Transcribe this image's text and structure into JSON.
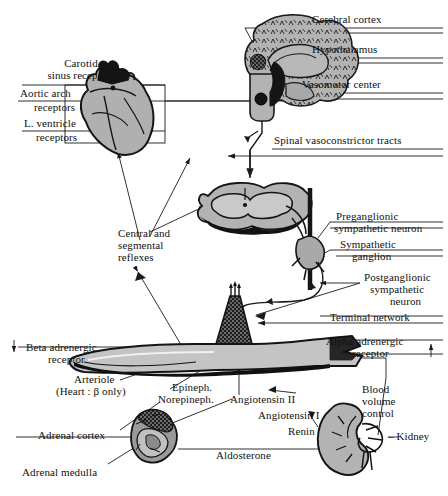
{
  "figure": {
    "type": "anatomical-flow-diagram",
    "background_color": "#ffffff",
    "line_color": "#1a1a1a",
    "organ_fill_color": "#b3b3b3",
    "dark_fill_color": "#141414"
  },
  "labels": {
    "cerebral_cortex": "Cerebral cortex",
    "hypothalamus": "Hypothalamus",
    "vasomotor_center": "Vasomotor center",
    "spinal_vasoconstrictor_tracts": "Spinal vasoconstrictor tracts",
    "carotid_sinus_receptors_l1": "Carotid",
    "carotid_sinus_receptors_l2": "sinus receptors",
    "aortic_arch_receptors_l1": "Aortic arch",
    "aortic_arch_receptors_l2": "receptors",
    "l_ventricle_receptors_l1": "L. ventricle",
    "l_ventricle_receptors_l2": "receptors",
    "central_segmental_reflexes_l1": "Central and",
    "central_segmental_reflexes_l2": "segmental",
    "central_segmental_reflexes_l3": "reflexes",
    "preganglionic_l1": "Preganglionic",
    "preganglionic_l2": "sympathetic neuron",
    "sympathetic_ganglion_l1": "Sympathetic",
    "sympathetic_ganglion_l2": "ganglion",
    "postganglionic_l1": "Postganglionic",
    "postganglionic_l2": "sympathetic",
    "postganglionic_l3": "neuron",
    "terminal_network": "Terminal network",
    "alpha_adrenergic_l1": "Alpha adrenergic",
    "alpha_adrenergic_l2": "receptor",
    "beta_adrenergic_l1": "Beta adrenergic",
    "beta_adrenergic_l2": "receptor",
    "arteriole_l1": "Arteriole",
    "arteriole_l2": "(Heart : β only)",
    "epineph_l1": "Epineph.",
    "epineph_l2": "Norepineph.",
    "angiotensin_ii": "Angiotensin II",
    "angiotensin_i": "Angiotensin I",
    "renin": "Renin",
    "blood_volume_control_l1": "Blood",
    "blood_volume_control_l2": "volume",
    "blood_volume_control_l3": "control",
    "kidney": "– Kidney",
    "adrenal_cortex": "Adrenal cortex",
    "adrenal_medulla": "Adrenal medulla",
    "aldosterone": "Aldosterone",
    "beta_arrow_glyph": "↓",
    "alpha_arrow_glyph": "↑"
  }
}
